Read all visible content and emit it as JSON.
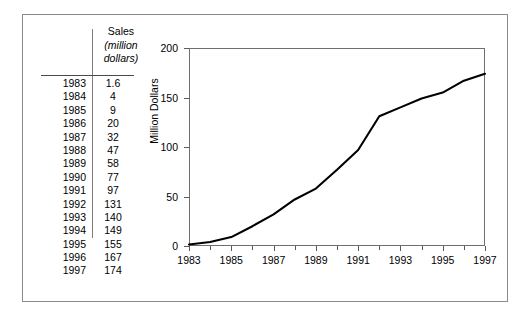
{
  "figure": {
    "table": {
      "header_year": "",
      "header_sales": "Sales",
      "header_unit": "(million dollars)",
      "header_unit_line1": "(million",
      "header_unit_line2": "dollars)",
      "rows": [
        {
          "year": "1983",
          "sales": "1.6"
        },
        {
          "year": "1984",
          "sales": "4"
        },
        {
          "year": "1985",
          "sales": "9"
        },
        {
          "year": "1986",
          "sales": "20"
        },
        {
          "year": "1987",
          "sales": "32"
        },
        {
          "year": "1988",
          "sales": "47"
        },
        {
          "year": "1989",
          "sales": "58"
        },
        {
          "year": "1990",
          "sales": "77"
        },
        {
          "year": "1991",
          "sales": "97"
        },
        {
          "year": "1992",
          "sales": "131"
        },
        {
          "year": "1993",
          "sales": "140"
        },
        {
          "year": "1994",
          "sales": "149"
        },
        {
          "year": "1995",
          "sales": "155"
        },
        {
          "year": "1996",
          "sales": "167"
        },
        {
          "year": "1997",
          "sales": "174"
        }
      ]
    }
  },
  "chart_data": {
    "type": "line",
    "title": "",
    "xlabel": "",
    "ylabel": "Million Dollars",
    "x": [
      1983,
      1984,
      1985,
      1986,
      1987,
      1988,
      1989,
      1990,
      1991,
      1992,
      1993,
      1994,
      1995,
      1996,
      1997
    ],
    "values": [
      1.6,
      4,
      9,
      20,
      32,
      47,
      58,
      77,
      97,
      131,
      140,
      149,
      155,
      167,
      174
    ],
    "xlim": [
      1983,
      1997
    ],
    "ylim": [
      0,
      200
    ],
    "ytick_labels": [
      "0",
      "50",
      "100",
      "150",
      "200"
    ],
    "ytick_values": [
      0,
      50,
      100,
      150,
      200
    ],
    "xtick_labels": [
      "1983",
      "1985",
      "1987",
      "1989",
      "1991",
      "1993",
      "1995",
      "1997"
    ],
    "xtick_values": [
      1983,
      1985,
      1987,
      1989,
      1991,
      1993,
      1995,
      1997
    ],
    "xminor_values": [
      1984,
      1986,
      1988,
      1990,
      1992,
      1994,
      1996
    ],
    "grid": false,
    "legend": false,
    "line_color": "#000000"
  }
}
